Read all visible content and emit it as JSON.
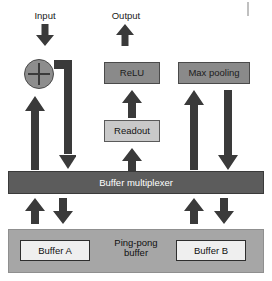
{
  "diagram": {
    "colors": {
      "arrow": "#3a3a3a",
      "mid_gray_box": "#8a8a8a",
      "light_gray_box": "#c9c9c9",
      "dark_bar": "#5c5c5c",
      "pane": "#a6a6a6",
      "buffer_box": "#efefef",
      "text_dark": "#1a1a1a",
      "text_light": "#ffffff",
      "background": "#ffffff"
    },
    "labels": {
      "input": "Input",
      "output": "Output"
    },
    "nodes": {
      "adder": {
        "label": "",
        "icon": "plus-circle-icon"
      },
      "relu": {
        "label": "ReLU"
      },
      "max_pooling": {
        "label": "Max pooling"
      },
      "readout": {
        "label": "Readout"
      },
      "buffer_multiplexer": {
        "label": "Buffer multiplexer"
      },
      "ping_pong_buffer": {
        "label_line1": "Ping-pong",
        "label_line2": "buffer"
      },
      "buffer_a": {
        "label": "Buffer A"
      },
      "buffer_b": {
        "label": "Buffer B"
      }
    },
    "arrows": [
      {
        "name": "input-down-arrow",
        "direction": "down"
      },
      {
        "name": "output-up-arrow",
        "direction": "up"
      },
      {
        "name": "adder-feed-up-arrow",
        "direction": "up"
      },
      {
        "name": "adder-output-elbow-down-arrow",
        "direction": "down"
      },
      {
        "name": "readout-input-up-arrow",
        "direction": "up"
      },
      {
        "name": "relu-input-up-arrow",
        "direction": "up"
      },
      {
        "name": "maxpool-input-up-arrow",
        "direction": "up"
      },
      {
        "name": "maxpool-output-down-arrow",
        "direction": "down"
      },
      {
        "name": "mux-left-up-arrow",
        "direction": "up"
      },
      {
        "name": "mux-left-down-arrow",
        "direction": "down"
      },
      {
        "name": "mux-right-up-arrow",
        "direction": "up"
      },
      {
        "name": "mux-right-down-arrow",
        "direction": "down"
      }
    ]
  }
}
